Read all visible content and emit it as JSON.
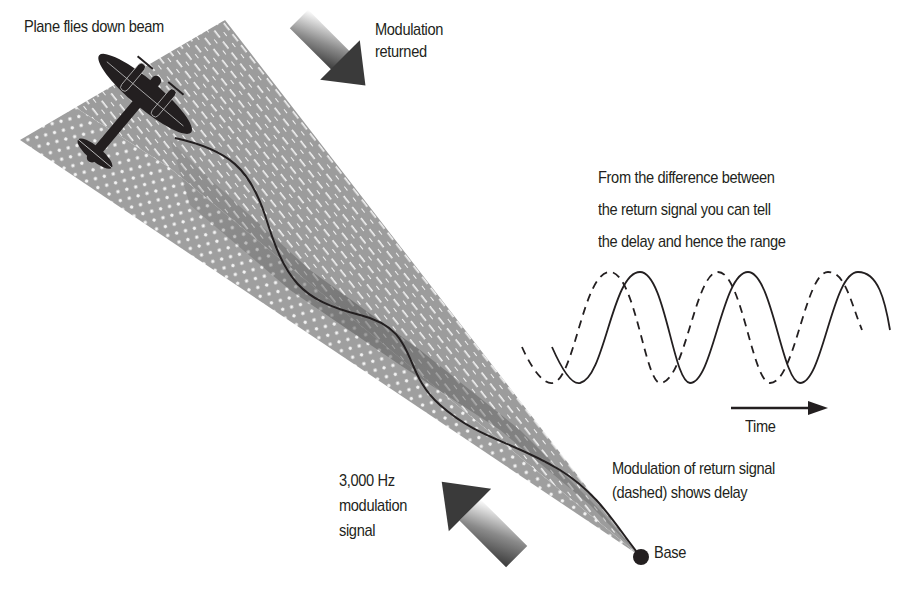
{
  "labels": {
    "plane": "Plane flies down beam",
    "returned_line1": "Modulation",
    "returned_line2": "returned",
    "explain_line1": "From the difference between",
    "explain_line2": "the return signal you can tell",
    "explain_line3": "the delay and hence the range",
    "time": "Time",
    "signal_line1": "3,000 Hz",
    "signal_line2": "modulation",
    "signal_line3": "signal",
    "return_line1": "Modulation of return signal",
    "return_line2": "(dashed) shows delay",
    "base": "Base"
  },
  "colors": {
    "ink": "#231f20",
    "beam_gray": "#9a9a9a",
    "beam_shadow": "#6e6e6e",
    "arrow_dark": "#3a3a3a"
  },
  "waves": {
    "solid": "outgoing modulation signal",
    "dashed": "return modulation signal (shifted, showing delay)",
    "cycles_visible": 3
  }
}
